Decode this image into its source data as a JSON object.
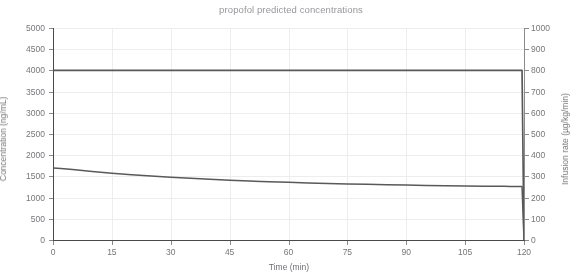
{
  "chart_data": {
    "type": "line",
    "title": "propofol predicted concentrations",
    "xlabel": "Time (min)",
    "ylabel": "Concentration (ng/mL)",
    "y2label": "Infusion rate (µg/kg/min)",
    "xlim": [
      0,
      120
    ],
    "ylim": [
      0,
      5000
    ],
    "y2lim": [
      0,
      1000
    ],
    "grid": true,
    "legend": "none",
    "xticks": [
      0,
      15,
      30,
      45,
      60,
      75,
      90,
      105,
      120
    ],
    "yticks": [
      0,
      500,
      1000,
      1500,
      2000,
      2500,
      3000,
      3500,
      4000,
      4500,
      5000
    ],
    "y2ticks": [
      0,
      100,
      200,
      300,
      400,
      500,
      600,
      700,
      800,
      900,
      1000
    ],
    "series": [
      {
        "name": "Concentration (ng/mL)",
        "axis": "left",
        "color": "#595959",
        "x": [
          0,
          2,
          5,
          10,
          15,
          20,
          25,
          30,
          35,
          40,
          45,
          50,
          55,
          60,
          65,
          70,
          75,
          80,
          85,
          90,
          95,
          100,
          105,
          110,
          115,
          118,
          119.5,
          120
        ],
        "values": [
          1700,
          1685,
          1660,
          1615,
          1575,
          1540,
          1510,
          1482,
          1455,
          1432,
          1410,
          1392,
          1375,
          1360,
          1345,
          1333,
          1322,
          1312,
          1303,
          1295,
          1288,
          1281,
          1275,
          1270,
          1265,
          1262,
          1260,
          0
        ]
      },
      {
        "name": "Infusion rate (µg/kg/min)",
        "axis": "right",
        "color": "#595959",
        "x": [
          0,
          15,
          30,
          45,
          60,
          75,
          90,
          105,
          119.5,
          120
        ],
        "values": [
          800,
          800,
          800,
          800,
          800,
          800,
          800,
          800,
          800,
          0
        ]
      }
    ]
  }
}
